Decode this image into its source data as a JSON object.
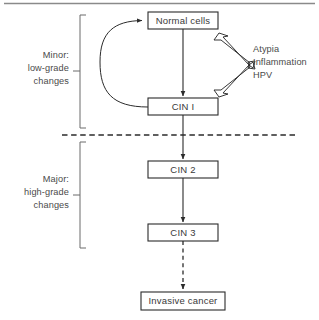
{
  "figure": {
    "top_rule": true
  },
  "nodes": [
    {
      "id": "normal-cells",
      "label": "Normal cells",
      "x": 148,
      "y": 12,
      "w": 70,
      "h": 17
    },
    {
      "id": "cin-1",
      "label": "CIN I",
      "x": 148,
      "y": 98,
      "w": 70,
      "h": 17
    },
    {
      "id": "cin-2",
      "label": "CIN 2",
      "x": 148,
      "y": 161,
      "w": 70,
      "h": 17
    },
    {
      "id": "cin-3",
      "label": "CIN 3",
      "x": 148,
      "y": 224,
      "w": 70,
      "h": 17
    },
    {
      "id": "invasive-cancer",
      "label": "Invasive cancer",
      "x": 141,
      "y": 292,
      "w": 84,
      "h": 18
    }
  ],
  "brackets": [
    {
      "id": "minor-bracket",
      "lines": [
        "Minor:",
        "low-grade",
        "changes"
      ],
      "top": 15,
      "bottom": 128,
      "x": 80,
      "tick_y": 71
    },
    {
      "id": "major-bracket",
      "lines": [
        "Major:",
        "high-grade",
        "changes"
      ],
      "top": 142,
      "bottom": 248,
      "x": 80,
      "tick_y": 195
    }
  ],
  "annotations": {
    "id": "risk-factors",
    "lines": [
      "Atypia",
      "Inflammation",
      "HPV"
    ],
    "x": 253,
    "first_line_y": 52,
    "line_height": 13
  },
  "edges": [
    {
      "id": "normal-to-cin1",
      "from": "normal-cells",
      "to": "cin-1",
      "style": "solid",
      "kind": "arrow"
    },
    {
      "id": "cin1-feedback",
      "from": "cin-1",
      "to": "normal-cells",
      "style": "solid",
      "kind": "curved-arrow"
    },
    {
      "id": "cin1-to-cin2",
      "from": "cin-1",
      "to": "cin-2",
      "style": "solid",
      "kind": "arrow"
    },
    {
      "id": "cin2-to-cin3",
      "from": "cin-2",
      "to": "cin-3",
      "style": "solid",
      "kind": "arrow"
    },
    {
      "id": "cin3-to-cancer",
      "from": "cin-3",
      "to": "invasive-cancer",
      "style": "dashed",
      "kind": "arrow"
    }
  ],
  "divider": {
    "id": "grade-divider",
    "style": "dashed",
    "x1": 62,
    "x2": 296,
    "y": 135
  },
  "colors": {
    "stroke": "#2b2b2b",
    "text": "#4a4a4a",
    "bracket": "#6b6b6b",
    "background": "#ffffff"
  }
}
